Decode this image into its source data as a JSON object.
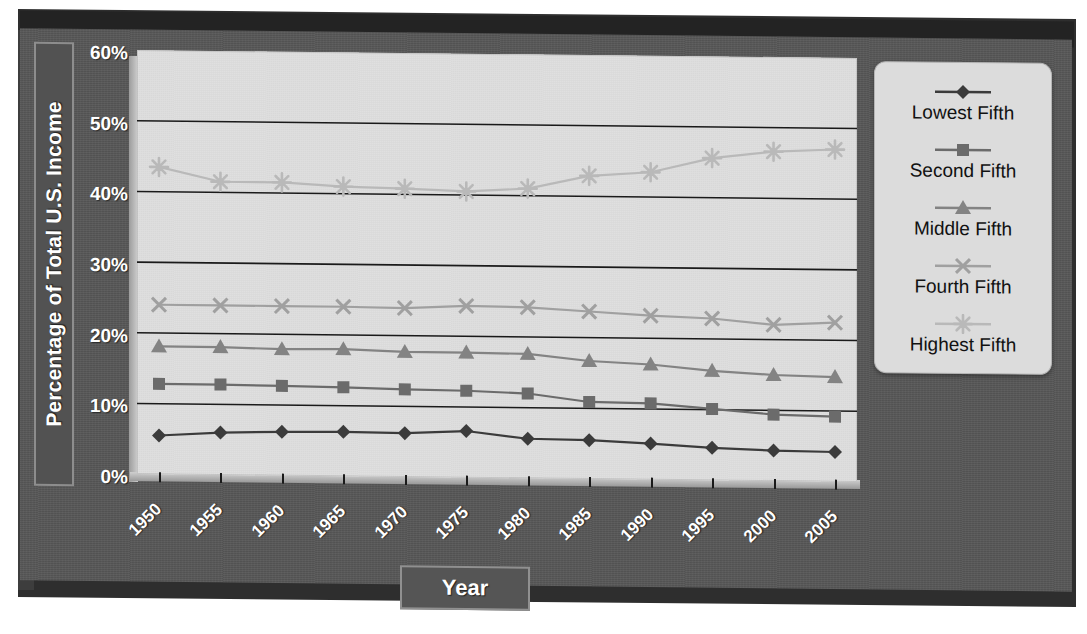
{
  "chart_data": {
    "type": "line",
    "title": "",
    "xlabel": "Year",
    "ylabel": "Percentage of Total U.S. Income",
    "x": [
      1950,
      1955,
      1960,
      1965,
      1970,
      1975,
      1980,
      1985,
      1990,
      1995,
      2000,
      2005
    ],
    "categories": [
      "1950",
      "1955",
      "1960",
      "1965",
      "1970",
      "1975",
      "1980",
      "1985",
      "1990",
      "1995",
      "2000",
      "2005"
    ],
    "xlim": [
      1950,
      2005
    ],
    "ylim": [
      0,
      60
    ],
    "yticks": [
      0,
      10,
      20,
      30,
      40,
      50,
      60
    ],
    "ytick_labels": [
      "0%",
      "10%",
      "20%",
      "30%",
      "40%",
      "50%",
      "60%"
    ],
    "grid": "horizontal",
    "legend_position": "right",
    "series": [
      {
        "name": "Lowest Fifth",
        "marker": "diamond",
        "color": "#3b3b3b",
        "values": [
          5.5,
          6.0,
          6.2,
          6.3,
          6.2,
          6.6,
          5.6,
          5.5,
          5.1,
          4.6,
          4.3,
          4.2
        ]
      },
      {
        "name": "Second Fifth",
        "marker": "square",
        "color": "#6b6b6b",
        "values": [
          12.8,
          12.8,
          12.7,
          12.6,
          12.4,
          12.3,
          12.0,
          10.9,
          10.8,
          10.1,
          9.4,
          9.2
        ]
      },
      {
        "name": "Middle Fifth",
        "marker": "triangle",
        "color": "#838383",
        "values": [
          18.1,
          18.1,
          17.9,
          18.0,
          17.7,
          17.7,
          17.6,
          16.7,
          16.3,
          15.5,
          15.0,
          14.8
        ]
      },
      {
        "name": "Fourth Fifth",
        "marker": "x",
        "color": "#a0a0a0",
        "values": [
          24.0,
          24.0,
          24.0,
          24.0,
          23.9,
          24.3,
          24.2,
          23.7,
          23.2,
          22.9,
          22.1,
          22.5
        ]
      },
      {
        "name": "Highest Fifth",
        "marker": "starburst",
        "color": "#b9b9b9",
        "values": [
          43.5,
          41.5,
          41.5,
          41.0,
          40.8,
          40.5,
          41.0,
          42.9,
          43.5,
          45.6,
          46.6,
          47.0
        ]
      }
    ]
  },
  "axis": {
    "y_title": "Percentage of Total U.S. Income",
    "x_title": "Year"
  },
  "legend": {
    "items": [
      {
        "label": "Lowest Fifth"
      },
      {
        "label": "Second Fifth"
      },
      {
        "label": "Middle Fifth"
      },
      {
        "label": "Fourth Fifth"
      },
      {
        "label": "Highest Fifth"
      }
    ]
  },
  "colors": {
    "panel": "#575757",
    "plot_background": "#dedede",
    "gridline": "#1a1a1a",
    "text_light": "#ffffff",
    "text_dark": "#111111"
  }
}
